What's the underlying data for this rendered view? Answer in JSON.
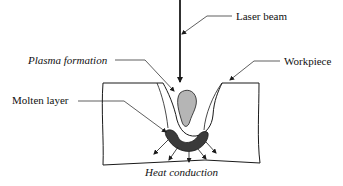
{
  "diagram": {
    "labels": {
      "laser_beam": "Laser beam",
      "workpiece": "Workpiece",
      "plasma_formation": "Plasma formation",
      "molten_layer": "Molten layer",
      "heat_conduction": "Heat conduction"
    },
    "colors": {
      "line": "#1a1a1a",
      "plasma_fill": "#b5b5b5",
      "molten_fill": "#3a3a3a",
      "background": "#ffffff"
    },
    "heat_arrow_count": 5
  }
}
